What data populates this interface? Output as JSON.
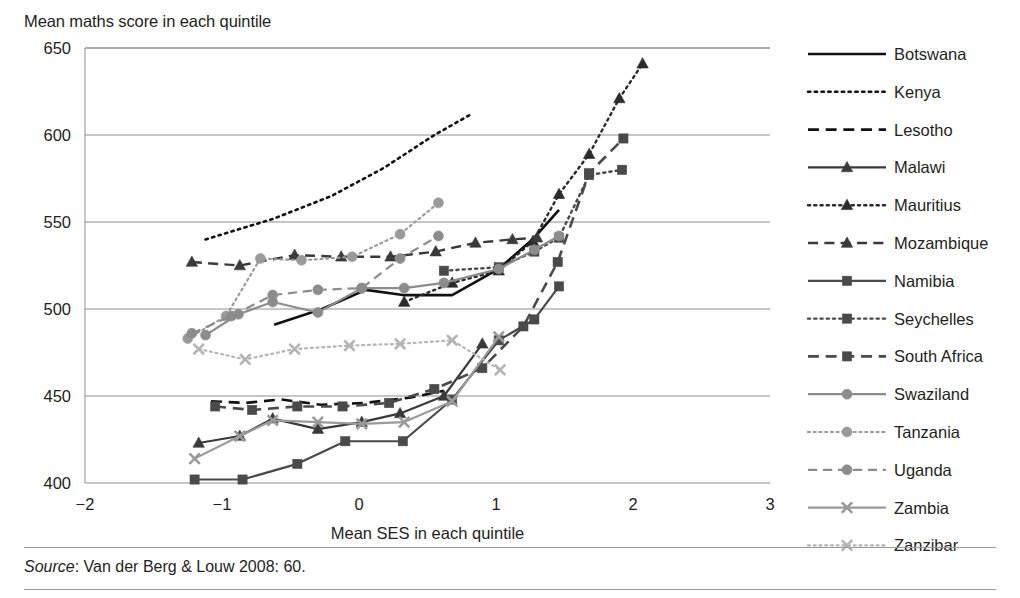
{
  "title": "Mean maths score in each quintile",
  "source_note": {
    "label": "Source",
    "text": ": Van der Berg & Louw 2008: 60."
  },
  "chart_data": {
    "type": "line",
    "title": "Mean maths score in each quintile",
    "xlabel": "Mean SES in each quintile",
    "ylabel": "Mean maths score in each quintile",
    "xlim": [
      -2,
      3
    ],
    "ylim": [
      400,
      650
    ],
    "xticks": [
      -2,
      -1,
      0,
      1,
      2,
      3
    ],
    "xtick_labels": [
      "−2",
      "−1",
      "0",
      "1",
      "2",
      "3"
    ],
    "yticks": [
      400,
      450,
      500,
      550,
      600,
      650
    ],
    "ytick_labels": [
      "400",
      "450",
      "500",
      "550",
      "600",
      "650"
    ],
    "grid": "horizontal",
    "legend_position": "right",
    "series": [
      {
        "name": "Botswana",
        "color": "#111111",
        "dash": "none",
        "marker": "none",
        "width": 2.6,
        "x": [
          -0.62,
          -0.27,
          0.05,
          0.32,
          0.68,
          1.02,
          1.28,
          1.46
        ],
        "y": [
          491,
          500,
          511,
          508,
          508,
          523,
          541,
          557
        ]
      },
      {
        "name": "Kenya",
        "color": "#111111",
        "dash": "dotted",
        "marker": "none",
        "width": 2.6,
        "x": [
          -1.12,
          -0.62,
          -0.2,
          0.18,
          0.55,
          0.82
        ],
        "y": [
          540,
          552,
          565,
          581,
          600,
          612
        ]
      },
      {
        "name": "Lesotho",
        "color": "#111111",
        "dash": "dashed",
        "marker": "none",
        "width": 2.6,
        "x": [
          -1.08,
          -0.83,
          -0.57,
          -0.28,
          0.04,
          0.37,
          0.62
        ],
        "y": [
          447,
          446,
          448,
          445,
          446,
          449,
          453
        ]
      },
      {
        "name": "Malawi",
        "color": "#3a3a3a",
        "dash": "none",
        "marker": "triangle",
        "width": 2.2,
        "x": [
          -1.17,
          -0.87,
          -0.63,
          -0.3,
          0.02,
          0.3,
          0.62,
          0.9
        ],
        "y": [
          423,
          427,
          437,
          431,
          435,
          440,
          450,
          480
        ]
      },
      {
        "name": "Mauritius",
        "color": "#2b2b2b",
        "dash": "dotted",
        "marker": "triangle",
        "width": 2.4,
        "x": [
          0.33,
          0.68,
          1.02,
          1.27,
          1.46,
          1.68,
          1.9,
          2.07
        ],
        "y": [
          504,
          515,
          522,
          539,
          566,
          589,
          621,
          641
        ]
      },
      {
        "name": "Mozambique",
        "color": "#3a3a3a",
        "dash": "dashed",
        "marker": "triangle",
        "width": 2.4,
        "x": [
          -1.22,
          -0.87,
          -0.47,
          -0.13,
          0.23,
          0.56,
          0.85,
          1.12,
          1.3
        ],
        "y": [
          527,
          525,
          531,
          530,
          530,
          533,
          538,
          540,
          541
        ]
      },
      {
        "name": "Namibia",
        "color": "#4a4a4a",
        "dash": "none",
        "marker": "square",
        "width": 2.2,
        "x": [
          -1.2,
          -0.85,
          -0.45,
          -0.1,
          0.32,
          0.68,
          1.02,
          1.28,
          1.46
        ],
        "y": [
          402,
          402,
          411,
          424,
          424,
          448,
          482,
          494,
          513
        ]
      },
      {
        "name": "Seychelles",
        "color": "#4a4a4a",
        "dash": "dotted",
        "marker": "square",
        "width": 2.4,
        "x": [
          0.62,
          1.02,
          1.28,
          1.46,
          1.68,
          1.92
        ],
        "y": [
          522,
          524,
          533,
          541,
          577,
          580
        ]
      },
      {
        "name": "South Africa",
        "color": "#4a4a4a",
        "dash": "dashed",
        "marker": "square",
        "width": 2.6,
        "x": [
          -1.05,
          -0.78,
          -0.45,
          -0.12,
          0.22,
          0.55,
          0.9,
          1.2,
          1.45,
          1.68,
          1.93
        ],
        "y": [
          444,
          442,
          444,
          444,
          446,
          454,
          466,
          490,
          527,
          578,
          598
        ]
      },
      {
        "name": "Swaziland",
        "color": "#8c8c8c",
        "dash": "none",
        "marker": "circle",
        "width": 2.2,
        "x": [
          -1.12,
          -0.88,
          -0.63,
          -0.3,
          0.02,
          0.33,
          0.62,
          1.02,
          1.28,
          1.46
        ],
        "y": [
          485,
          497,
          504,
          498,
          512,
          512,
          515,
          523,
          534,
          542
        ]
      },
      {
        "name": "Tanzania",
        "color": "#9a9a9a",
        "dash": "dotted",
        "marker": "circle",
        "width": 2.2,
        "x": [
          -1.25,
          -0.97,
          -0.72,
          -0.42,
          -0.05,
          0.3,
          0.58
        ],
        "y": [
          483,
          496,
          529,
          528,
          530,
          543,
          561
        ]
      },
      {
        "name": "Uganda",
        "color": "#8c8c8c",
        "dash": "dashed",
        "marker": "circle",
        "width": 2.2,
        "x": [
          -1.22,
          -0.93,
          -0.63,
          -0.3,
          0.02,
          0.3,
          0.58
        ],
        "y": [
          486,
          496,
          508,
          511,
          512,
          529,
          542
        ]
      },
      {
        "name": "Zambia",
        "color": "#9a9a9a",
        "dash": "none",
        "marker": "x",
        "width": 2.2,
        "x": [
          -1.2,
          -0.87,
          -0.63,
          -0.3,
          0.02,
          0.33,
          0.68,
          1.02
        ],
        "y": [
          414,
          427,
          436,
          435,
          434,
          435,
          447,
          484
        ]
      },
      {
        "name": "Zanzibar",
        "color": "#b4b4b4",
        "dash": "dotted",
        "marker": "x",
        "width": 2.2,
        "x": [
          -1.17,
          -0.83,
          -0.47,
          -0.07,
          0.3,
          0.68,
          1.03
        ],
        "y": [
          477,
          471,
          477,
          479,
          480,
          482,
          465
        ]
      }
    ]
  },
  "legend": {
    "items": [
      {
        "label": "Botswana"
      },
      {
        "label": "Kenya"
      },
      {
        "label": "Lesotho"
      },
      {
        "label": "Malawi"
      },
      {
        "label": "Mauritius"
      },
      {
        "label": "Mozambique"
      },
      {
        "label": "Namibia"
      },
      {
        "label": "Seychelles"
      },
      {
        "label": "South Africa"
      },
      {
        "label": "Swaziland"
      },
      {
        "label": "Tanzania"
      },
      {
        "label": "Uganda"
      },
      {
        "label": "Zambia"
      },
      {
        "label": "Zanzibar"
      }
    ]
  }
}
